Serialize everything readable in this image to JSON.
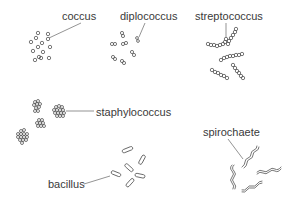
{
  "diagram": {
    "type": "bacteria-shapes",
    "labels": {
      "coccus": "coccus",
      "diplococcus": "diplococcus",
      "streptococcus": "streptococcus",
      "staphylococcus": "staphylococcus",
      "bacillus": "bacillus",
      "spirochaete": "spirochaete"
    },
    "colors": {
      "background": "#ffffff",
      "stroke": "#555555",
      "text": "#3a3a3a"
    }
  }
}
